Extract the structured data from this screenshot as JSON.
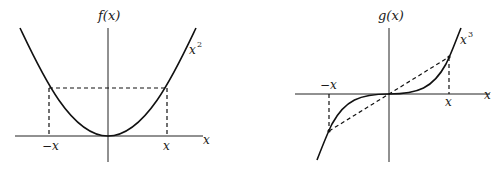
{
  "figures": [
    {
      "id": "even-function",
      "axis_label_y": "f(x)",
      "axis_label_x": "x",
      "curve_label_base": "x",
      "curve_label_exp": "2",
      "tick_neg": "−x",
      "tick_pos": "x"
    },
    {
      "id": "odd-function",
      "axis_label_y": "g(x)",
      "axis_label_x": "x",
      "curve_label_base": "x",
      "curve_label_exp": "3",
      "tick_neg": "−x",
      "tick_pos": "x"
    }
  ],
  "colors": {
    "ink": "#111111",
    "background": "#ffffff"
  }
}
